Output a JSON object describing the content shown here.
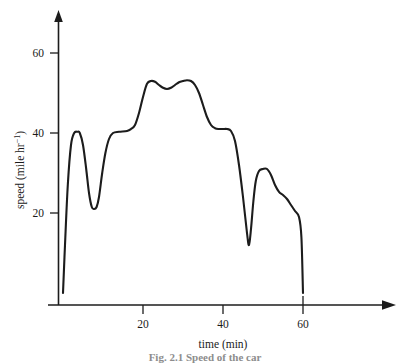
{
  "figure": {
    "background_color": "#ffffff",
    "line_color": "#1c1c1c",
    "caption": "Fig. 2.1  Speed of the car"
  },
  "axes": {
    "y": {
      "title_main": "speed (mile hr",
      "title_sup": "−1",
      "title_tail": ")",
      "title_full": "speed (mile hr−1)",
      "ticks": [
        {
          "value": 20,
          "label": "20"
        },
        {
          "value": 40,
          "label": "40"
        },
        {
          "value": 60,
          "label": "60"
        }
      ]
    },
    "x": {
      "title": "time (min)",
      "ticks": [
        {
          "value": 20,
          "label": "20"
        },
        {
          "value": 40,
          "label": "40"
        },
        {
          "value": 60,
          "label": "60"
        }
      ]
    }
  },
  "chart_data": {
    "type": "line",
    "title": "",
    "subtitle": "",
    "xlabel": "time (min)",
    "ylabel": "speed (mile hr−1)",
    "xlim": [
      0,
      72
    ],
    "ylim": [
      0,
      68
    ],
    "xticks": [
      20,
      40,
      60
    ],
    "yticks": [
      20,
      40,
      60
    ],
    "grid": false,
    "legend": false,
    "legend_position": "none",
    "series": [
      {
        "name": "speed",
        "x": [
          0,
          0.5,
          1.2,
          2.0,
          2.8,
          3.6,
          4.2,
          5.0,
          5.8,
          6.5,
          7.2,
          7.8,
          8.4,
          9.0,
          9.8,
          10.6,
          11.5,
          12.5,
          14.0,
          16.0,
          17.0,
          18.0,
          19.0,
          20.0,
          21.0,
          22.0,
          23.0,
          24.0,
          25.0,
          26.0,
          27.0,
          28.0,
          29.0,
          30.0,
          31.0,
          32.0,
          33.0,
          34.0,
          35.0,
          36.0,
          37.0,
          38.0,
          39.0,
          40.0,
          41.0,
          42.0,
          43.0,
          44.0,
          45.0,
          46.0,
          46.5,
          47.0,
          47.6,
          48.2,
          49.0,
          50.0,
          51.0,
          52.0,
          53.0,
          54.0,
          55.0,
          56.0,
          57.0,
          58.0,
          59.0,
          59.6,
          60.0
        ],
        "y": [
          0,
          12,
          27,
          37,
          40,
          40.3,
          40,
          37,
          31,
          25,
          21.5,
          21,
          21.5,
          24,
          30,
          35,
          38.5,
          40,
          40.3,
          40.5,
          41,
          42,
          45,
          49,
          52.3,
          53,
          52.8,
          52,
          51.3,
          51,
          51.3,
          52,
          52.7,
          53,
          53.2,
          53,
          52,
          50,
          47,
          44,
          42,
          41.2,
          41,
          41,
          41,
          40.5,
          38,
          32,
          24,
          15,
          12,
          16,
          23,
          28,
          30.5,
          31,
          31,
          29.5,
          27,
          25.3,
          24.5,
          23.5,
          22,
          20.5,
          19,
          14,
          0
        ],
        "color": "#1c1c1c",
        "style": "solid"
      }
    ],
    "annotations": [
      {
        "text": "initial acceleration to 40 mile/hr",
        "x": 3
      },
      {
        "text": "dip to about 21 mile/hr",
        "x": 7.5
      },
      {
        "text": "cruise plateau near 53 mile/hr",
        "x": 26
      },
      {
        "text": "sharp dip to about 12 mile/hr",
        "x": 46.5
      },
      {
        "text": "final stop at 60 min",
        "x": 60
      }
    ]
  }
}
